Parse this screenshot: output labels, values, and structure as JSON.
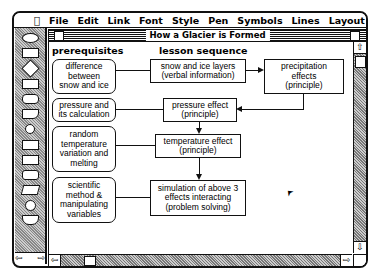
{
  "menubar": {
    "apple": "",
    "items": [
      "File",
      "Edit",
      "Link",
      "Font",
      "Style",
      "Pen",
      "Symbols",
      "Lines",
      "Layout"
    ]
  },
  "window": {
    "title": "How a Glacier is Formed"
  },
  "headings": {
    "prerequisites": "prerequisites",
    "lesson_sequence": "lesson sequence"
  },
  "prerequisites": [
    {
      "lines": [
        "difference",
        "between",
        "snow and ice"
      ]
    },
    {
      "lines": [
        "pressure and",
        "its calculation"
      ]
    },
    {
      "lines": [
        "random",
        "temperature",
        "variation and",
        "melting"
      ]
    },
    {
      "lines": [
        "scientific",
        "method &",
        "manipulating",
        "variables"
      ]
    }
  ],
  "sequence": [
    {
      "lines": [
        "snow and ice layers",
        "(verbal information)"
      ]
    },
    {
      "lines": [
        "precipitation",
        "effects",
        "(principle)"
      ]
    },
    {
      "lines": [
        "pressure effect",
        "(principle)"
      ]
    },
    {
      "lines": [
        "temperature effect",
        "(principle)"
      ]
    },
    {
      "lines": [
        "simulation of above 3",
        "effects interacting",
        "(problem solving)"
      ]
    }
  ],
  "icons": {
    "scroll_up": "⇧",
    "scroll_down": "⇩",
    "scroll_left": "⇦",
    "scroll_right": "⇨",
    "cursor": "➤"
  }
}
